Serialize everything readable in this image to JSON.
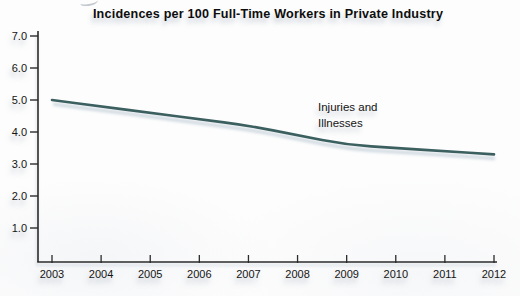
{
  "chart": {
    "title": "Incidences per 100 Full-Time Workers in Private Industry",
    "annotation": "Injuries and\nIllnesses"
  },
  "chart_data": {
    "type": "line",
    "title": "Incidences per 100 Full-Time Workers in Private Industry",
    "categories": [
      "2003",
      "2004",
      "2005",
      "2006",
      "2007",
      "2008",
      "2009",
      "2010",
      "2011",
      "2012"
    ],
    "series": [
      {
        "name": "Injuries and Illnesses",
        "values": [
          5.0,
          4.8,
          4.6,
          4.4,
          4.2,
          3.9,
          3.6,
          3.5,
          3.4,
          3.3
        ]
      }
    ],
    "xlabel": "",
    "ylabel": "",
    "ylim": [
      0,
      7.0
    ],
    "y_tick_labels": [
      "1.0",
      "2.0",
      "3.0",
      "4.0",
      "5.0",
      "6.0",
      "7.0"
    ],
    "y_tick_values": [
      1.0,
      2.0,
      3.0,
      4.0,
      5.0,
      6.0,
      7.0
    ],
    "grid": false,
    "legend_position": "none",
    "annotation_text": "Injuries and\nIllnesses",
    "colors": {
      "line": "#3c5f60",
      "line_shadow": "#8fa6b8",
      "axis": "#2b2b2b",
      "text": "#151515",
      "background": "#fdfdfd"
    }
  }
}
